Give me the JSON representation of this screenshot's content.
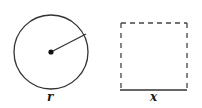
{
  "diagram": {
    "circle": {
      "label": "r",
      "center": [
        51,
        52
      ],
      "radius": 37,
      "radius_end": [
        86,
        34
      ]
    },
    "square": {
      "label": "x",
      "x": 121,
      "y": 23,
      "size": 66,
      "bottom_edge": "solid",
      "other_edges": "dashed"
    },
    "colors": {
      "stroke": "#333333",
      "background": "#ffffff"
    }
  }
}
